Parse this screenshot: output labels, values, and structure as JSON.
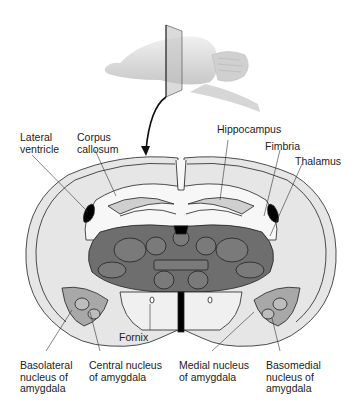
{
  "figure": {
    "type": "neuroanatomy-diagram",
    "overview": "Lateral view of rodent brain with a vertical coronal cutting plane; arrow points down to coronal section",
    "colors": {
      "background": "#ffffff",
      "outer_tissue": "#e6e6e6",
      "white_matter": "#f7f7f7",
      "thalamus_fill": "#6e6e6e",
      "amygdala_fill": "#a8a8a8",
      "ventricle_fill": "#000000",
      "outline": "#222222",
      "brain_3d": "#dcdcdc"
    }
  },
  "labels": {
    "lateral_ventricle": "Lateral\nventricle",
    "corpus_callosum": "Corpus\ncallosum",
    "hippocampus": "Hippocampus",
    "fimbria": "Fimbria",
    "thalamus": "Thalamus",
    "fornix": "Fornix",
    "basolateral": "Basolateral\nnucleus of\namygdala",
    "central": "Central nucleus\nof amygdala",
    "medial": "Medial nucleus\nof amygdala",
    "basomedial": "Basomedial\nnucleus of\namygdala"
  }
}
